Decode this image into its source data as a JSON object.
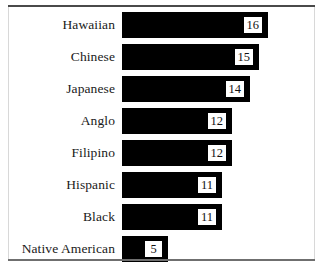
{
  "chart_data": {
    "type": "bar",
    "orientation": "horizontal",
    "title": "",
    "subtitle": "",
    "xlabel": "",
    "ylabel": "",
    "grid": false,
    "legend": null,
    "axis_ticks": [],
    "xlim": [
      0,
      16
    ],
    "categories": [
      "Hawaiian",
      "Chinese",
      "Japanese",
      "Anglo",
      "Filipino",
      "Hispanic",
      "Black",
      "Native American"
    ],
    "values": [
      16,
      15,
      14,
      12,
      12,
      11,
      11,
      5
    ],
    "value_labels": [
      "16",
      "15",
      "14",
      "12",
      "12",
      "11",
      "11",
      "5"
    ],
    "bar_color": "#000000",
    "value_box_background": "#ffffff",
    "value_box_border_color": "#000000",
    "background_color": "#ffffff",
    "rule_color": "#4a4a4a"
  }
}
